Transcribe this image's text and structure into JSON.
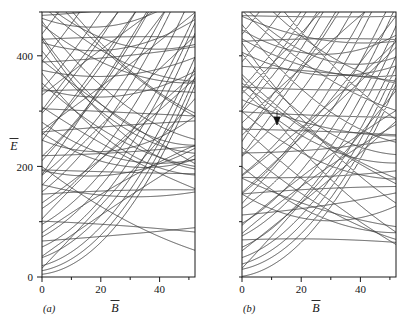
{
  "figure": {
    "background": "#ffffff",
    "line_color": "#3a3a3a",
    "axis_color": "#1a1a1a"
  },
  "panels": [
    {
      "id": "a",
      "label": "(a)",
      "xlabel": "B",
      "xlabel_overbar": true,
      "ylabel": "E",
      "ylabel_overbar": true,
      "xticks": [
        "0",
        "20",
        "40"
      ],
      "xtick_values": [
        0,
        20,
        40
      ],
      "yticks": [
        "0",
        "200",
        "400"
      ],
      "ytick_values": [
        0,
        200,
        400
      ],
      "minor_ytick_values": [
        100,
        300,
        500
      ],
      "xlim": [
        0,
        52
      ],
      "ylim": [
        0,
        500
      ],
      "crossing_type": "real-crossings",
      "annotation": null
    },
    {
      "id": "b",
      "label": "(b)",
      "xlabel": "B",
      "xlabel_overbar": true,
      "ylabel": "",
      "ylabel_overbar": false,
      "xticks": [
        "0",
        "20",
        "40"
      ],
      "xtick_values": [
        0,
        20,
        40
      ],
      "yticks": [],
      "ytick_values": [],
      "minor_ytick_values": [
        100,
        200,
        300,
        400,
        500
      ],
      "xlim": [
        0,
        52
      ],
      "ylim": [
        0,
        500
      ],
      "crossing_type": "avoided-crossings",
      "annotation": {
        "type": "down-arrow",
        "x": 11.5,
        "y": 272
      }
    }
  ],
  "chart_data": {
    "type": "line",
    "title": "",
    "xlabel": "B",
    "ylabel": "E",
    "xlim": [
      0,
      52
    ],
    "ylim": [
      0,
      500
    ],
    "grid": false,
    "legend": "none",
    "panel_a": {
      "xticks": [
        0,
        20,
        40
      ],
      "yticks": [
        0,
        200,
        400
      ],
      "n_levels": 46,
      "series": [
        {
          "name": "level-1",
          "E0": 2,
          "curvature": 0.055,
          "slope": 0.35
        },
        {
          "name": "level-2",
          "E0": 14,
          "curvature": 0.05,
          "slope": 0.3
        },
        {
          "name": "level-3",
          "E0": 30,
          "curvature": 0.045,
          "slope": 0.25
        },
        {
          "name": "level-4",
          "E0": 48,
          "curvature": 0.04,
          "slope": 0.2
        },
        {
          "name": "level-5",
          "E0": 70,
          "curvature": 0.035,
          "slope": 0.15
        },
        {
          "name": "level-6",
          "E0": 95,
          "curvature": 0.03,
          "slope": 0.1
        },
        {
          "name": "level-7",
          "E0": 120,
          "curvature": 0.026,
          "slope": 0.05
        },
        {
          "name": "level-8",
          "E0": 148,
          "curvature": 0.022,
          "slope": 0.0
        },
        {
          "name": "level-9",
          "E0": 178,
          "curvature": 0.018,
          "slope": -0.05
        },
        {
          "name": "level-10",
          "E0": 208,
          "curvature": 0.014,
          "slope": -0.1
        },
        {
          "name": "level-11",
          "E0": 240,
          "curvature": 0.01,
          "slope": -0.15
        },
        {
          "name": "level-12",
          "E0": 272,
          "curvature": 0.008,
          "slope": -0.2
        },
        {
          "name": "level-13",
          "E0": 305,
          "curvature": 0.006,
          "slope": -0.25
        },
        {
          "name": "level-14",
          "E0": 340,
          "curvature": 0.004,
          "slope": -0.3
        },
        {
          "name": "level-15",
          "E0": 375,
          "curvature": 0.003,
          "slope": -0.35
        },
        {
          "name": "level-16",
          "E0": 410,
          "curvature": 0.002,
          "slope": -0.4
        },
        {
          "name": "level-17",
          "E0": 448,
          "curvature": 0.001,
          "slope": -0.45
        },
        {
          "name": "level-18",
          "E0": 485,
          "curvature": 0.001,
          "slope": -0.5
        }
      ]
    },
    "panel_b": {
      "xticks": [
        0,
        20,
        40
      ],
      "yticks": [],
      "n_levels": 46,
      "note": "Same level density as panel (a) but with repulsion: crossings are avoided."
    }
  }
}
